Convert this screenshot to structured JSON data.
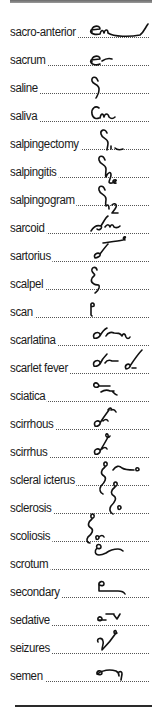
{
  "entries": [
    {
      "term": "sacro-anterior",
      "glyph": "sacro-anterior-outline-icon"
    },
    {
      "term": "sacrum",
      "glyph": "sacrum-outline-icon"
    },
    {
      "term": "saline",
      "glyph": "saline-outline-icon"
    },
    {
      "term": "saliva",
      "glyph": "saliva-outline-icon"
    },
    {
      "term": "salpingectomy",
      "glyph": "salpingectomy-outline-icon"
    },
    {
      "term": "salpingitis",
      "glyph": "salpingitis-outline-icon"
    },
    {
      "term": "salpingogram",
      "glyph": "salpingogram-outline-icon"
    },
    {
      "term": "sarcoid",
      "glyph": "sarcoid-outline-icon"
    },
    {
      "term": "sartorius",
      "glyph": "sartorius-outline-icon"
    },
    {
      "term": "scalpel",
      "glyph": "scalpel-outline-icon"
    },
    {
      "term": "scan",
      "glyph": "scan-outline-icon"
    },
    {
      "term": "scarlatina",
      "glyph": "scarlatina-outline-icon"
    },
    {
      "term": "scarlet fever",
      "glyph": "scarlet-fever-outline-icon"
    },
    {
      "term": "sciatica",
      "glyph": "sciatica-outline-icon"
    },
    {
      "term": "scirrhous",
      "glyph": "scirrhous-outline-icon"
    },
    {
      "term": "scirrhus",
      "glyph": "scirrhus-outline-icon"
    },
    {
      "term": "scleral icterus",
      "glyph": "scleral-icterus-outline-icon"
    },
    {
      "term": "sclerosis",
      "glyph": "sclerosis-outline-icon"
    },
    {
      "term": "scoliosis",
      "glyph": "scoliosis-outline-icon"
    },
    {
      "term": "scrotum",
      "glyph": "scrotum-outline-icon"
    },
    {
      "term": "secondary",
      "glyph": "secondary-outline-icon"
    },
    {
      "term": "sedative",
      "glyph": "sedative-outline-icon"
    },
    {
      "term": "seizures",
      "glyph": "seizures-outline-icon"
    },
    {
      "term": "semen",
      "glyph": "semen-outline-icon"
    }
  ]
}
